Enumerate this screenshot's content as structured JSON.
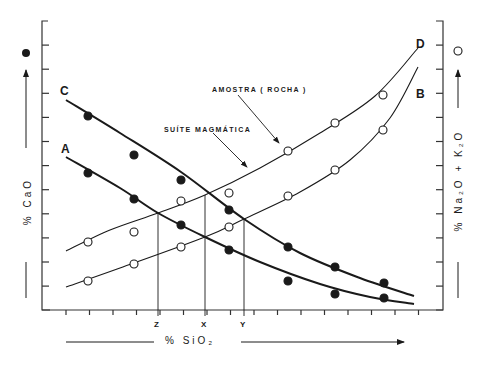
{
  "chart_data": {
    "type": "line",
    "title": "",
    "xlabel": "% SiO2",
    "ylabel_left": "% CaO",
    "ylabel_right": "% Na2O + K2O",
    "left_axis_marker": "filled-circle",
    "right_axis_marker": "open-circle",
    "grid": false,
    "legend_position": "none",
    "x_ticks_count": 16,
    "y_ticks_count": 11,
    "x_marks": [
      {
        "label": "Z",
        "px": 158
      },
      {
        "label": "X",
        "px": 205
      },
      {
        "label": "Y",
        "px": 244
      }
    ],
    "annotations": [
      {
        "text": "AMOSTRA (ROCHA)",
        "target": "intersection C × D at X"
      },
      {
        "text": "SUÍTE MAGMÁTICA",
        "target": "curve D near X"
      }
    ],
    "series": [
      {
        "name": "C",
        "axis": "left",
        "marker": "filled",
        "stroke": "thick",
        "points_px": [
          [
            88,
            116
          ],
          [
            134,
            155
          ],
          [
            181,
            180
          ],
          [
            229,
            210
          ],
          [
            288,
            247
          ],
          [
            335,
            267
          ],
          [
            384,
            283
          ]
        ],
        "curve_px": [
          [
            66,
            100
          ],
          [
            120,
            133
          ],
          [
            181,
            172
          ],
          [
            244,
            219
          ],
          [
            300,
            253
          ],
          [
            360,
            278
          ],
          [
            414,
            296
          ]
        ]
      },
      {
        "name": "A",
        "axis": "left",
        "marker": "filled",
        "stroke": "thick",
        "points_px": [
          [
            88,
            173
          ],
          [
            134,
            199
          ],
          [
            181,
            225
          ],
          [
            229,
            250
          ],
          [
            288,
            281
          ],
          [
            335,
            294
          ],
          [
            384,
            298
          ]
        ],
        "curve_px": [
          [
            66,
            157
          ],
          [
            120,
            188
          ],
          [
            158,
            213
          ],
          [
            205,
            237
          ],
          [
            260,
            262
          ],
          [
            320,
            284
          ],
          [
            370,
            297
          ],
          [
            414,
            304
          ]
        ]
      },
      {
        "name": "D",
        "axis": "right",
        "marker": "open",
        "stroke": "thin",
        "points_px": [
          [
            88,
            242
          ],
          [
            134,
            232
          ],
          [
            181,
            201
          ],
          [
            229,
            193
          ],
          [
            288,
            151
          ],
          [
            335,
            123
          ],
          [
            383,
            95
          ]
        ],
        "curve_px": [
          [
            66,
            251
          ],
          [
            110,
            230
          ],
          [
            158,
            213
          ],
          [
            205,
            195
          ],
          [
            260,
            168
          ],
          [
            320,
            133
          ],
          [
            375,
            96
          ],
          [
            418,
            48
          ]
        ]
      },
      {
        "name": "B",
        "axis": "right",
        "marker": "open",
        "stroke": "thin",
        "points_px": [
          [
            88,
            281
          ],
          [
            134,
            264
          ],
          [
            181,
            247
          ],
          [
            229,
            227
          ],
          [
            288,
            196
          ],
          [
            335,
            170
          ],
          [
            383,
            130
          ]
        ],
        "curve_px": [
          [
            66,
            287
          ],
          [
            120,
            268
          ],
          [
            205,
            237
          ],
          [
            244,
            219
          ],
          [
            300,
            192
          ],
          [
            350,
            160
          ],
          [
            390,
            118
          ],
          [
            418,
            67
          ]
        ]
      }
    ]
  },
  "labels": {
    "curve_c": "C",
    "curve_a": "A",
    "curve_d": "D",
    "curve_b": "B",
    "amostra": "AMOSTRA  ( ROCHA )",
    "suite": "SUÍTE  MAGMÁTICA",
    "mark_z": "Z",
    "mark_x": "X",
    "mark_y": "Y",
    "x_axis_title": "%   SiO₂",
    "left_axis_title": "%   CaO",
    "right_axis_title": "%   Na₂O  +  K₂O"
  }
}
